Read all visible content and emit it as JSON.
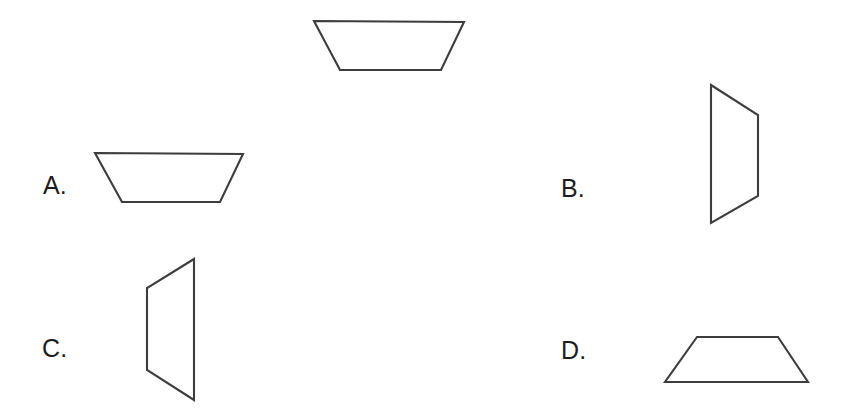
{
  "figure": {
    "type": "geometry-multiple-choice",
    "background_color": "#ffffff",
    "stroke_color": "#3d3d3d",
    "stroke_width": 2.1,
    "width": 847,
    "height": 415,
    "prompt_shape": {
      "name": "reference-trapezoid",
      "description": "Isosceles trapezoid with the longer parallel side on top",
      "orientation": "longer-base-up",
      "points": "314,21 464,22 441,70 340,70",
      "vertices": [
        {
          "x": 314,
          "y": 21
        },
        {
          "x": 464,
          "y": 22
        },
        {
          "x": 441,
          "y": 70
        },
        {
          "x": 340,
          "y": 70
        }
      ]
    },
    "options": [
      {
        "id": "A",
        "label": "A.",
        "shape_name": "option-a-trapezoid",
        "description": "Isosceles trapezoid, longer parallel side on top (same orientation as reference)",
        "orientation": "longer-base-up",
        "points": "95,153 243,154 220,202 122,202",
        "vertices": [
          {
            "x": 95,
            "y": 153
          },
          {
            "x": 243,
            "y": 154
          },
          {
            "x": 220,
            "y": 202
          },
          {
            "x": 122,
            "y": 202
          }
        ]
      },
      {
        "id": "B",
        "label": "B.",
        "shape_name": "option-b-trapezoid",
        "description": "Trapezoid rotated 90 degrees, longer parallel side on the left",
        "orientation": "rotated-90-longer-side-left",
        "points": "711,85 758,115 758,196 711,223",
        "vertices": [
          {
            "x": 711,
            "y": 85
          },
          {
            "x": 758,
            "y": 115
          },
          {
            "x": 758,
            "y": 196
          },
          {
            "x": 711,
            "y": 223
          }
        ]
      },
      {
        "id": "C",
        "label": "C.",
        "shape_name": "option-c-trapezoid",
        "description": "Trapezoid rotated 90 degrees, longer parallel side on the right",
        "orientation": "rotated-90-longer-side-right",
        "points": "194,259 194,400 147,370 147,288",
        "vertices": [
          {
            "x": 194,
            "y": 259
          },
          {
            "x": 194,
            "y": 400
          },
          {
            "x": 147,
            "y": 370
          },
          {
            "x": 147,
            "y": 288
          }
        ]
      },
      {
        "id": "D",
        "label": "D.",
        "shape_name": "option-d-trapezoid",
        "description": "Isosceles trapezoid flipped vertically, longer parallel side on the bottom",
        "orientation": "longer-base-down",
        "points": "697,337 778,337 808,382 665,382",
        "vertices": [
          {
            "x": 697,
            "y": 337
          },
          {
            "x": 778,
            "y": 337
          },
          {
            "x": 808,
            "y": 382
          },
          {
            "x": 665,
            "y": 382
          }
        ]
      }
    ]
  }
}
